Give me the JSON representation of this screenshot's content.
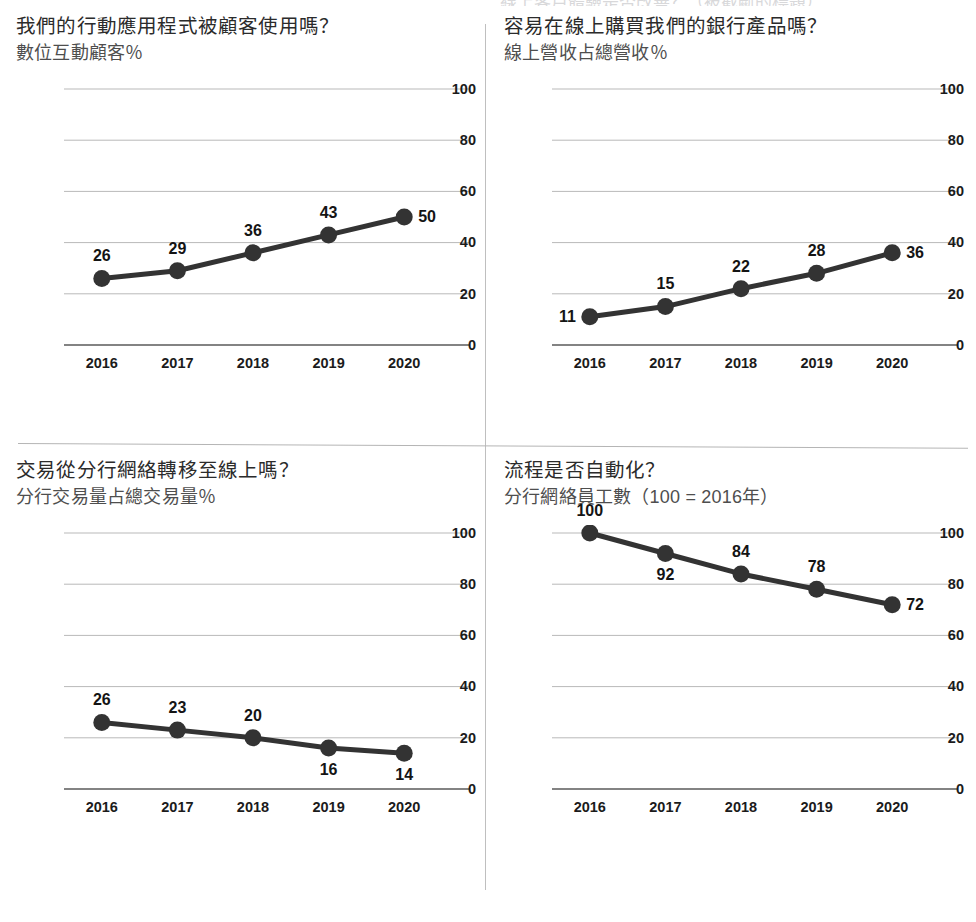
{
  "page": {
    "top_cut_text": "線上客戶體驗是否改善？（被截斷的標題）",
    "line_color": "#333333",
    "grid_color": "#b9b9b9",
    "axis_color": "#5a5a5a"
  },
  "panels": [
    {
      "id": "mobile-app-usage",
      "title": "我們的行動應用程式被顧客使用嗎？",
      "subtitle": "數位互動顧客％",
      "chart_data": {
        "type": "line",
        "title": "我們的行動應用程式被顧客使用嗎？",
        "subtitle": "數位互動顧客％",
        "xlabel": "",
        "ylabel": "數位互動顧客％",
        "categories": [
          "2016",
          "2017",
          "2018",
          "2019",
          "2020"
        ],
        "values": [
          26,
          29,
          36,
          43,
          50
        ],
        "ylim": [
          0,
          100
        ],
        "yticks": [
          0,
          20,
          40,
          60,
          80,
          100
        ],
        "grid": true,
        "legend": "none",
        "label_positions": [
          "above",
          "above",
          "above",
          "above",
          "right"
        ]
      }
    },
    {
      "id": "online-product-purchase",
      "title": "容易在線上購買我們的銀行產品嗎？",
      "subtitle": "線上營收占總營收％",
      "chart_data": {
        "type": "line",
        "title": "容易在線上購買我們的銀行產品嗎？",
        "subtitle": "線上營收占總營收％",
        "xlabel": "",
        "ylabel": "線上營收占總營收％",
        "categories": [
          "2016",
          "2017",
          "2018",
          "2019",
          "2020"
        ],
        "values": [
          11,
          15,
          22,
          28,
          36
        ],
        "ylim": [
          0,
          100
        ],
        "yticks": [
          0,
          20,
          40,
          60,
          80,
          100
        ],
        "grid": true,
        "legend": "none",
        "label_positions": [
          "left",
          "above",
          "above",
          "above",
          "right"
        ]
      }
    },
    {
      "id": "branch-to-online-shift",
      "title": "交易從分行網絡轉移至線上嗎？",
      "subtitle": "分行交易量占總交易量％",
      "chart_data": {
        "type": "line",
        "title": "交易從分行網絡轉移至線上嗎？",
        "subtitle": "分行交易量占總交易量％",
        "xlabel": "",
        "ylabel": "分行交易量占總交易量％",
        "categories": [
          "2016",
          "2017",
          "2018",
          "2019",
          "2020"
        ],
        "values": [
          26,
          23,
          20,
          16,
          14
        ],
        "ylim": [
          0,
          100
        ],
        "yticks": [
          0,
          20,
          40,
          60,
          80,
          100
        ],
        "grid": true,
        "legend": "none",
        "label_positions": [
          "above",
          "above",
          "above",
          "below",
          "below"
        ]
      }
    },
    {
      "id": "process-automation",
      "title": "流程是否自動化？",
      "subtitle": "分行網絡員工數（100 = 2016年）",
      "chart_data": {
        "type": "line",
        "title": "流程是否自動化？",
        "subtitle": "分行網絡員工數（100 = 2016年）",
        "xlabel": "",
        "ylabel": "分行網絡員工數（100 = 2016年）",
        "categories": [
          "2016",
          "2017",
          "2018",
          "2019",
          "2020"
        ],
        "values": [
          100,
          92,
          84,
          78,
          72
        ],
        "ylim": [
          0,
          100
        ],
        "yticks": [
          0,
          20,
          40,
          60,
          80,
          100
        ],
        "grid": true,
        "legend": "none",
        "label_positions": [
          "above",
          "below",
          "above",
          "above",
          "right"
        ]
      }
    }
  ]
}
